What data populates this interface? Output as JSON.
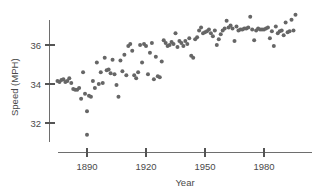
{
  "chart_data": {
    "type": "scatter",
    "title": "",
    "xlabel": "Year",
    "ylabel": "Speed (MPH)",
    "xlim": [
      1873,
      1997
    ],
    "ylim": [
      31.0,
      37.8
    ],
    "xticks": [
      1890,
      1920,
      1950,
      1980
    ],
    "xtick_labels": [
      "1890",
      "1920",
      "1950",
      "1980"
    ],
    "yticks": [
      32,
      34,
      36
    ],
    "ytick_labels": [
      "32",
      "34",
      "36"
    ],
    "grid": false,
    "legend": null,
    "marker_color": "#666666",
    "marker_size": 4,
    "axis_color": "#6e6e6e",
    "series": [
      {
        "name": "Winning speed",
        "points": [
          [
            1875,
            34.15
          ],
          [
            1876,
            34.1
          ],
          [
            1877,
            34.2
          ],
          [
            1878,
            34.25
          ],
          [
            1879,
            34.1
          ],
          [
            1880,
            34.15
          ],
          [
            1881,
            34.3
          ],
          [
            1882,
            34.05
          ],
          [
            1883,
            33.75
          ],
          [
            1884,
            33.7
          ],
          [
            1885,
            33.7
          ],
          [
            1886,
            33.8
          ],
          [
            1887,
            33.25
          ],
          [
            1888,
            34.6
          ],
          [
            1889,
            33.5
          ],
          [
            1890,
            31.4
          ],
          [
            1890,
            32.6
          ],
          [
            1891,
            33.4
          ],
          [
            1892,
            33.35
          ],
          [
            1893,
            34.15
          ],
          [
            1894,
            33.8
          ],
          [
            1895,
            35.1
          ],
          [
            1896,
            34.0
          ],
          [
            1897,
            34.6
          ],
          [
            1898,
            34.05
          ],
          [
            1899,
            35.35
          ],
          [
            1900,
            34.7
          ],
          [
            1901,
            34.75
          ],
          [
            1902,
            34.55
          ],
          [
            1903,
            35.25
          ],
          [
            1904,
            34.5
          ],
          [
            1905,
            33.95
          ],
          [
            1906,
            33.35
          ],
          [
            1907,
            35.2
          ],
          [
            1908,
            34.65
          ],
          [
            1909,
            35.5
          ],
          [
            1910,
            34.45
          ],
          [
            1911,
            35.95
          ],
          [
            1912,
            36.05
          ],
          [
            1913,
            35.7
          ],
          [
            1914,
            34.45
          ],
          [
            1915,
            34.3
          ],
          [
            1916,
            34.6
          ],
          [
            1917,
            36.0
          ],
          [
            1918,
            35.1
          ],
          [
            1919,
            36.05
          ],
          [
            1920,
            35.95
          ],
          [
            1921,
            34.5
          ],
          [
            1922,
            35.6
          ],
          [
            1923,
            36.1
          ],
          [
            1924,
            34.25
          ],
          [
            1925,
            35.4
          ],
          [
            1926,
            34.4
          ],
          [
            1927,
            34.35
          ],
          [
            1928,
            35.15
          ],
          [
            1929,
            36.25
          ],
          [
            1930,
            36.1
          ],
          [
            1931,
            35.95
          ],
          [
            1932,
            36.0
          ],
          [
            1933,
            36.15
          ],
          [
            1934,
            36.05
          ],
          [
            1935,
            36.6
          ],
          [
            1936,
            35.9
          ],
          [
            1937,
            36.2
          ],
          [
            1938,
            36.1
          ],
          [
            1939,
            35.95
          ],
          [
            1940,
            36.2
          ],
          [
            1941,
            36.05
          ],
          [
            1942,
            36.35
          ],
          [
            1943,
            35.45
          ],
          [
            1944,
            35.35
          ],
          [
            1945,
            36.3
          ],
          [
            1946,
            36.4
          ],
          [
            1947,
            36.75
          ],
          [
            1948,
            36.9
          ],
          [
            1949,
            36.6
          ],
          [
            1950,
            36.65
          ],
          [
            1951,
            36.7
          ],
          [
            1952,
            36.8
          ],
          [
            1953,
            36.6
          ],
          [
            1954,
            36.45
          ],
          [
            1955,
            36.75
          ],
          [
            1956,
            36.0
          ],
          [
            1957,
            36.3
          ],
          [
            1958,
            36.55
          ],
          [
            1959,
            36.75
          ],
          [
            1960,
            36.85
          ],
          [
            1961,
            37.25
          ],
          [
            1962,
            36.9
          ],
          [
            1963,
            37.0
          ],
          [
            1964,
            36.85
          ],
          [
            1965,
            36.2
          ],
          [
            1966,
            36.95
          ],
          [
            1967,
            36.75
          ],
          [
            1968,
            36.8
          ],
          [
            1969,
            36.8
          ],
          [
            1970,
            36.85
          ],
          [
            1971,
            36.85
          ],
          [
            1972,
            36.9
          ],
          [
            1973,
            37.45
          ],
          [
            1974,
            36.8
          ],
          [
            1975,
            36.25
          ],
          [
            1976,
            36.75
          ],
          [
            1977,
            36.85
          ],
          [
            1978,
            36.8
          ],
          [
            1979,
            36.8
          ],
          [
            1980,
            36.8
          ],
          [
            1981,
            36.85
          ],
          [
            1982,
            36.9
          ],
          [
            1983,
            36.35
          ],
          [
            1984,
            36.7
          ],
          [
            1985,
            35.95
          ],
          [
            1986,
            36.95
          ],
          [
            1987,
            36.6
          ],
          [
            1988,
            36.7
          ],
          [
            1989,
            36.75
          ],
          [
            1990,
            36.5
          ],
          [
            1991,
            37.15
          ],
          [
            1992,
            36.65
          ],
          [
            1993,
            36.7
          ],
          [
            1994,
            37.3
          ],
          [
            1995,
            36.75
          ],
          [
            1996,
            37.55
          ]
        ]
      }
    ]
  }
}
